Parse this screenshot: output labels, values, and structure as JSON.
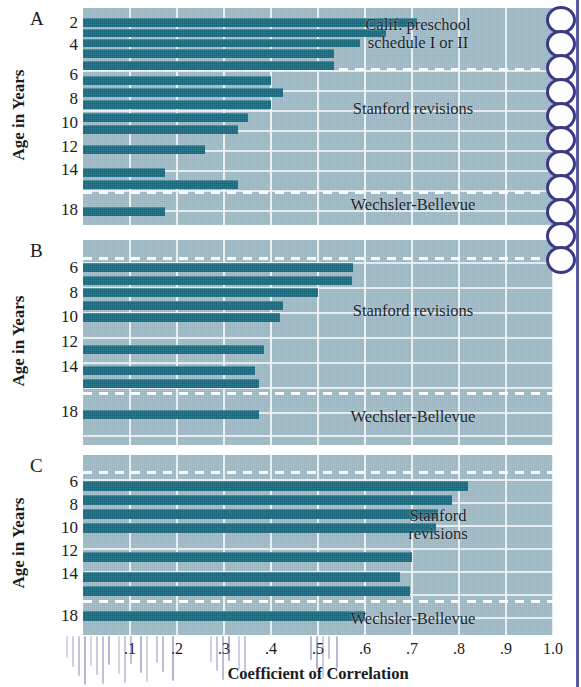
{
  "figure": {
    "x_axis_title": "Coefficient of Correlation",
    "y_axis_title": "Age in Years",
    "x_ticks": [
      ".1",
      ".2",
      ".3",
      ".4",
      ".5",
      ".6",
      ".7",
      ".8",
      ".9",
      "1.0"
    ],
    "x_tick_values": [
      0.1,
      0.2,
      0.3,
      0.4,
      0.5,
      0.6,
      0.7,
      0.8,
      0.9,
      1.0
    ],
    "colors": {
      "bar": "#17697e",
      "plot_background": "#9eb9c5",
      "gridline": "#f2f7f8",
      "dashed_divider": "#ffffff",
      "text": "#15151c",
      "binding": "#3b3b8c"
    }
  },
  "panels": [
    {
      "letter": "A",
      "y_axis_title": "Age in Years",
      "y_labels": [
        "2",
        "4",
        "6",
        "8",
        "10",
        "12",
        "14",
        "18"
      ],
      "group_labels": [
        {
          "text": "Calif. preschool\nschedule I or II"
        },
        {
          "text": "Stanford revisions"
        },
        {
          "text": "Wechsler-Bellevue"
        }
      ]
    },
    {
      "letter": "B",
      "y_axis_title": "Age in Years",
      "y_labels": [
        "6",
        "8",
        "10",
        "12",
        "14",
        "18"
      ],
      "group_labels": [
        {
          "text": "Stanford revisions"
        },
        {
          "text": "Wechsler-Bellevue"
        }
      ]
    },
    {
      "letter": "C",
      "y_axis_title": "Age in Years",
      "y_labels": [
        "6",
        "8",
        "10",
        "12",
        "14",
        "18"
      ],
      "group_labels": [
        {
          "text": "Stanford\nrevisions"
        },
        {
          "text": "Wechsler-Bellevue"
        }
      ]
    }
  ],
  "chart_data": [
    {
      "type": "bar",
      "orientation": "horizontal",
      "title": "A",
      "xlabel": "Coefficient of Correlation",
      "ylabel": "Age in Years",
      "xlim": [
        0,
        1.0
      ],
      "grid": true,
      "categories": [
        "2",
        "3",
        "4",
        "5",
        "5.5",
        "6",
        "7",
        "8",
        "9",
        "10",
        "12",
        "14",
        "15",
        "18"
      ],
      "values": [
        0.71,
        0.645,
        0.59,
        0.535,
        0.535,
        0.4,
        0.425,
        0.4,
        0.35,
        0.33,
        0.26,
        0.175,
        0.33,
        0.175
      ],
      "test_groups": [
        {
          "name": "Calif. preschool schedule I or II",
          "rows": [
            "2",
            "3",
            "4",
            "5",
            "5.5"
          ]
        },
        {
          "name": "Stanford revisions",
          "rows": [
            "6",
            "7",
            "8",
            "9",
            "10",
            "12",
            "14",
            "15"
          ]
        },
        {
          "name": "Wechsler-Bellevue",
          "rows": [
            "18"
          ]
        }
      ]
    },
    {
      "type": "bar",
      "orientation": "horizontal",
      "title": "B",
      "xlabel": "Coefficient of Correlation",
      "ylabel": "Age in Years",
      "xlim": [
        0,
        1.0
      ],
      "grid": true,
      "categories": [
        "6",
        "7",
        "8",
        "9",
        "10",
        "12",
        "14",
        "15",
        "18"
      ],
      "values": [
        0.575,
        0.572,
        0.5,
        0.425,
        0.42,
        0.385,
        0.365,
        0.375,
        0.375
      ],
      "test_groups": [
        {
          "name": "Stanford revisions",
          "rows": [
            "6",
            "7",
            "8",
            "9",
            "10",
            "12",
            "14",
            "15"
          ]
        },
        {
          "name": "Wechsler-Bellevue",
          "rows": [
            "18"
          ]
        }
      ]
    },
    {
      "type": "bar",
      "orientation": "horizontal",
      "title": "C",
      "xlabel": "Coefficient of Correlation",
      "ylabel": "Age in Years",
      "xlim": [
        0,
        1.0
      ],
      "grid": true,
      "categories": [
        "7",
        "8",
        "9",
        "10",
        "12",
        "14",
        "15",
        "18"
      ],
      "values": [
        0.82,
        0.785,
        0.755,
        0.75,
        0.7,
        0.675,
        0.695,
        0.6
      ],
      "test_groups": [
        {
          "name": "Stanford revisions",
          "rows": [
            "7",
            "8",
            "9",
            "10",
            "12",
            "14",
            "15"
          ]
        },
        {
          "name": "Wechsler-Bellevue",
          "rows": [
            "18"
          ]
        }
      ]
    }
  ],
  "layout": {
    "plot_left_px": 83,
    "plot_right_px": 553,
    "panels_px": [
      {
        "top": 8,
        "height": 217
      },
      {
        "top": 240,
        "height": 205
      },
      {
        "top": 455,
        "height": 180
      }
    ],
    "panel_A": {
      "bars": [
        {
          "y": 10,
          "h": 9,
          "v": 0.71
        },
        {
          "y": 21,
          "h": 8,
          "v": 0.645
        },
        {
          "y": 31,
          "h": 8,
          "v": 0.59
        },
        {
          "y": 41,
          "h": 9,
          "v": 0.535
        },
        {
          "y": 53,
          "h": 9,
          "v": 0.535
        },
        {
          "y": 68,
          "h": 9,
          "v": 0.4
        },
        {
          "y": 80,
          "h": 9,
          "v": 0.425
        },
        {
          "y": 92,
          "h": 9,
          "v": 0.4
        },
        {
          "y": 105,
          "h": 9,
          "v": 0.35
        },
        {
          "y": 117,
          "h": 9,
          "v": 0.33
        },
        {
          "y": 137,
          "h": 9,
          "v": 0.26
        },
        {
          "y": 160,
          "h": 9,
          "v": 0.175
        },
        {
          "y": 172,
          "h": 9,
          "v": 0.33
        },
        {
          "y": 199,
          "h": 9,
          "v": 0.175
        }
      ],
      "hgrids": [
        62,
        82,
        102,
        122,
        142,
        162,
        182,
        202
      ],
      "dashed": [
        60,
        183
      ],
      "ylabels": [
        {
          "t": "2",
          "y": 6
        },
        {
          "t": "4",
          "y": 28
        },
        {
          "t": "6",
          "y": 58
        },
        {
          "t": "8",
          "y": 82
        },
        {
          "t": "10",
          "y": 106
        },
        {
          "t": "12",
          "y": 130
        },
        {
          "t": "14",
          "y": 153
        },
        {
          "t": "18",
          "y": 193
        }
      ],
      "glabels": [
        {
          "t": "Calif. preschool\nschedule I or II",
          "x": 328,
          "y": 8,
          "w": 180
        },
        {
          "t": "Stanford revisions",
          "x": 318,
          "y": 92,
          "w": 190
        },
        {
          "t": "Wechsler-Bellevue",
          "x": 318,
          "y": 188,
          "w": 190
        }
      ]
    },
    "panel_B": {
      "bars": [
        {
          "y": 23,
          "h": 9,
          "v": 0.575
        },
        {
          "y": 36,
          "h": 9,
          "v": 0.572
        },
        {
          "y": 48,
          "h": 9,
          "v": 0.5
        },
        {
          "y": 61,
          "h": 9,
          "v": 0.425
        },
        {
          "y": 73,
          "h": 9,
          "v": 0.42
        },
        {
          "y": 105,
          "h": 9,
          "v": 0.385
        },
        {
          "y": 126,
          "h": 9,
          "v": 0.365
        },
        {
          "y": 139,
          "h": 9,
          "v": 0.375
        },
        {
          "y": 170,
          "h": 9,
          "v": 0.375
        }
      ],
      "hgrids": [
        22,
        47,
        72,
        97,
        122,
        147,
        172,
        195
      ],
      "dashed": [
        17,
        152
      ],
      "ylabels": [
        {
          "t": "6",
          "y": 19
        },
        {
          "t": "8",
          "y": 44
        },
        {
          "t": "10",
          "y": 68
        },
        {
          "t": "12",
          "y": 93
        },
        {
          "t": "14",
          "y": 118
        },
        {
          "t": "18",
          "y": 163
        }
      ],
      "glabels": [
        {
          "t": "Stanford revisions",
          "x": 318,
          "y": 62,
          "w": 190
        },
        {
          "t": "Wechsler-Bellevue",
          "x": 318,
          "y": 168,
          "w": 190
        }
      ]
    },
    "panel_C": {
      "bars": [
        {
          "y": 26,
          "h": 10,
          "v": 0.82
        },
        {
          "y": 40,
          "h": 10,
          "v": 0.785
        },
        {
          "y": 54,
          "h": 10,
          "v": 0.755
        },
        {
          "y": 68,
          "h": 10,
          "v": 0.75
        },
        {
          "y": 97,
          "h": 10,
          "v": 0.7
        },
        {
          "y": 117,
          "h": 10,
          "v": 0.675
        },
        {
          "y": 131,
          "h": 10,
          "v": 0.695
        },
        {
          "y": 156,
          "h": 10,
          "v": 0.6
        }
      ],
      "hgrids": [
        24,
        47,
        70,
        93,
        116,
        139,
        162
      ],
      "dashed": [
        16,
        145
      ],
      "ylabels": [
        {
          "t": "6",
          "y": 18
        },
        {
          "t": "8",
          "y": 41
        },
        {
          "t": "10",
          "y": 64
        },
        {
          "t": "12",
          "y": 87
        },
        {
          "t": "14",
          "y": 110
        },
        {
          "t": "18",
          "y": 152
        }
      ],
      "glabels": [
        {
          "t": "Stanford\nrevisions",
          "x": 368,
          "y": 52,
          "w": 140
        },
        {
          "t": "Wechsler-Bellevue",
          "x": 318,
          "y": 155,
          "w": 190
        }
      ]
    }
  }
}
